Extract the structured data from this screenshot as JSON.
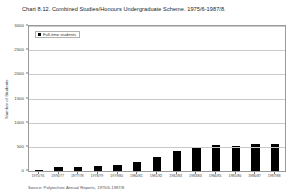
{
  "chart_data": {
    "type": "bar",
    "title": "Chart 8.12. Combined Studies/Honours Undergraduate Scheme. 1975/6-1987/8.",
    "xlabel": "",
    "ylabel": "Number of Students",
    "ylim": [
      0,
      3000
    ],
    "yticks": [
      0,
      500,
      1000,
      1500,
      2000,
      2500,
      3000
    ],
    "ytick_labels": [
      "0",
      "500",
      "1000",
      "1500",
      "2000",
      "2500",
      "3000"
    ],
    "grid": true,
    "legend_position": "top-left",
    "legend": [
      "Full-time students"
    ],
    "bar_color": "#000000",
    "categories": [
      "1975/76",
      "1976/77",
      "1977/78",
      "1978/79",
      "1979/80",
      "1980/81",
      "1981/82",
      "1982/83",
      "1983/84",
      "1984/85",
      "1985/86",
      "1986/87",
      "1987/88"
    ],
    "series": [
      {
        "name": "Full-time students",
        "values": [
          30,
          80,
          90,
          95,
          130,
          180,
          300,
          420,
          500,
          530,
          520,
          560,
          555
        ]
      }
    ],
    "source": "Source: Polytechnic Annual Reports, 1975/6-1987/8."
  }
}
